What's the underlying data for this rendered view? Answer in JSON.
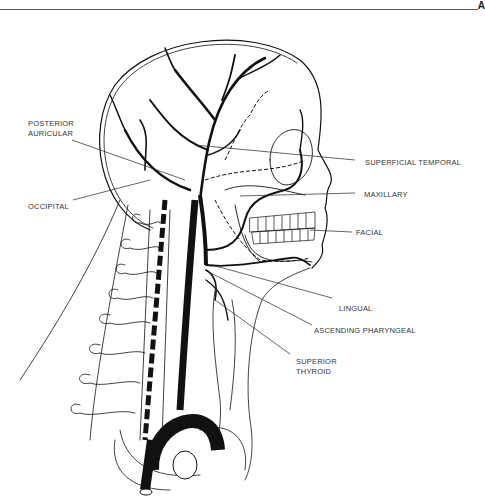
{
  "header": {
    "corner_letter": "A"
  },
  "figure": {
    "labels": [
      {
        "id": "posterior-auricular",
        "text": "POSTERIOR\nAURICULAR"
      },
      {
        "id": "occipital",
        "text": "OCCIPITAL"
      },
      {
        "id": "superficial-temporal",
        "text": "SUPERFICIAL TEMPORAL"
      },
      {
        "id": "maxillary",
        "text": "MAXILLARY"
      },
      {
        "id": "facial",
        "text": "FACIAL"
      },
      {
        "id": "lingual",
        "text": "LINGUAL"
      },
      {
        "id": "ascending-pharyngeal",
        "text": "ASCENDING PHARYNGEAL"
      },
      {
        "id": "superior-thyroid",
        "text": "SUPERIOR\nTHYROID"
      }
    ]
  }
}
